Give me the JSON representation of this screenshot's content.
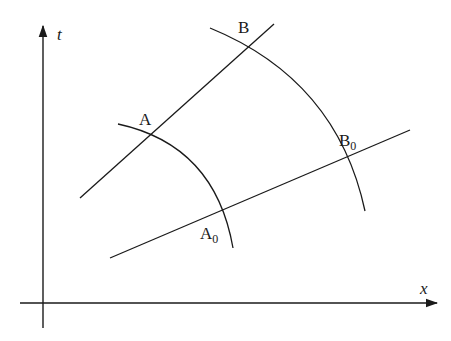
{
  "diagram": {
    "type": "spacetime-diagram",
    "axes": {
      "vertical": {
        "label": "t"
      },
      "horizontal": {
        "label": "x"
      }
    },
    "points": {
      "A": {
        "label": "A"
      },
      "B": {
        "label": "B"
      },
      "A0": {
        "label": "A",
        "subscript": "0"
      },
      "B0": {
        "label": "B",
        "subscript": "0"
      }
    },
    "lines": [
      {
        "name": "worldline-AB",
        "through": [
          "A",
          "B"
        ]
      },
      {
        "name": "worldline-A0B0",
        "through": [
          "A0",
          "B0"
        ]
      }
    ],
    "arcs": [
      {
        "name": "arc-A-A0",
        "through": [
          "A",
          "A0"
        ]
      },
      {
        "name": "arc-B-B0",
        "through": [
          "B",
          "B0"
        ]
      }
    ],
    "colors": {
      "stroke": "#1a1a1a",
      "background": "#ffffff"
    }
  }
}
